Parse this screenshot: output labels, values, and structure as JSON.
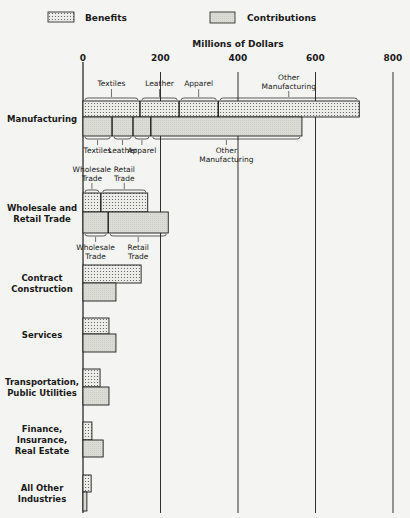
{
  "chart_data": {
    "type": "bar",
    "orientation": "horizontal",
    "title": "",
    "xlabel": "Millions of Dollars",
    "ylabel": "",
    "xlim": [
      0,
      800
    ],
    "x_ticks": [
      0,
      200,
      400,
      600,
      800
    ],
    "x_tick_labels": [
      "0",
      "200",
      "400",
      "600",
      "800"
    ],
    "grid": "vertical gridlines at each tick",
    "legend": {
      "placement": "top",
      "entries": [
        {
          "name": "Benefits",
          "pattern": "dotted"
        },
        {
          "name": "Contributions",
          "pattern": "light-gray"
        }
      ]
    },
    "categories": [
      "Manufacturing",
      "Wholesale and Retail Trade",
      "Contract Construction",
      "Services",
      "Transportation, Public Utilities",
      "Finance, Insurance, Real Estate",
      "All Other Industries"
    ],
    "category_label_lines": [
      [
        "Manufacturing"
      ],
      [
        "Wholesale and",
        "Retail Trade"
      ],
      [
        "Contract",
        "Construction"
      ],
      [
        "Services"
      ],
      [
        "Transportation,",
        "Public Utilities"
      ],
      [
        "Finance,",
        "Insurance,",
        "Real Estate"
      ],
      [
        "All Other",
        "Industries"
      ]
    ],
    "series": [
      {
        "name": "Benefits",
        "values": [
          713,
          167,
          150,
          67,
          44,
          23,
          21
        ],
        "segments": [
          [
            {
              "label": [
                "Textiles"
              ],
              "value": 147
            },
            {
              "label": [
                "Leather"
              ],
              "value": 101
            },
            {
              "label": [
                "Apparel"
              ],
              "value": 101
            },
            {
              "label": [
                "Other",
                "Manufacturing"
              ],
              "value": 364
            }
          ],
          [
            {
              "label": [
                "Wholesale",
                "Trade"
              ],
              "value": 46
            },
            {
              "label": [
                "Retail",
                "Trade"
              ],
              "value": 121
            }
          ],
          null,
          null,
          null,
          null,
          null
        ]
      },
      {
        "name": "Contributions",
        "values": [
          565,
          220,
          85,
          85,
          67,
          52,
          10
        ],
        "segments": [
          [
            {
              "label": [
                "Textiles"
              ],
              "value": 75
            },
            {
              "label": [
                "Leather"
              ],
              "value": 54
            },
            {
              "label": [
                "Apparel"
              ],
              "value": 46
            },
            {
              "label": [
                "Other",
                "Manufacturing"
              ],
              "value": 390
            }
          ],
          [
            {
              "label": [
                "Wholesale",
                "Trade"
              ],
              "value": 65
            },
            {
              "label": [
                "Retail",
                "Trade"
              ],
              "value": 155
            }
          ],
          null,
          null,
          null,
          null,
          null
        ]
      }
    ]
  },
  "colors": {
    "background": "#f4f4f2",
    "ink": "#1a1a1a",
    "benefits_fill": "#e4e4e0",
    "contributions_fill": "#dcdcd8"
  }
}
